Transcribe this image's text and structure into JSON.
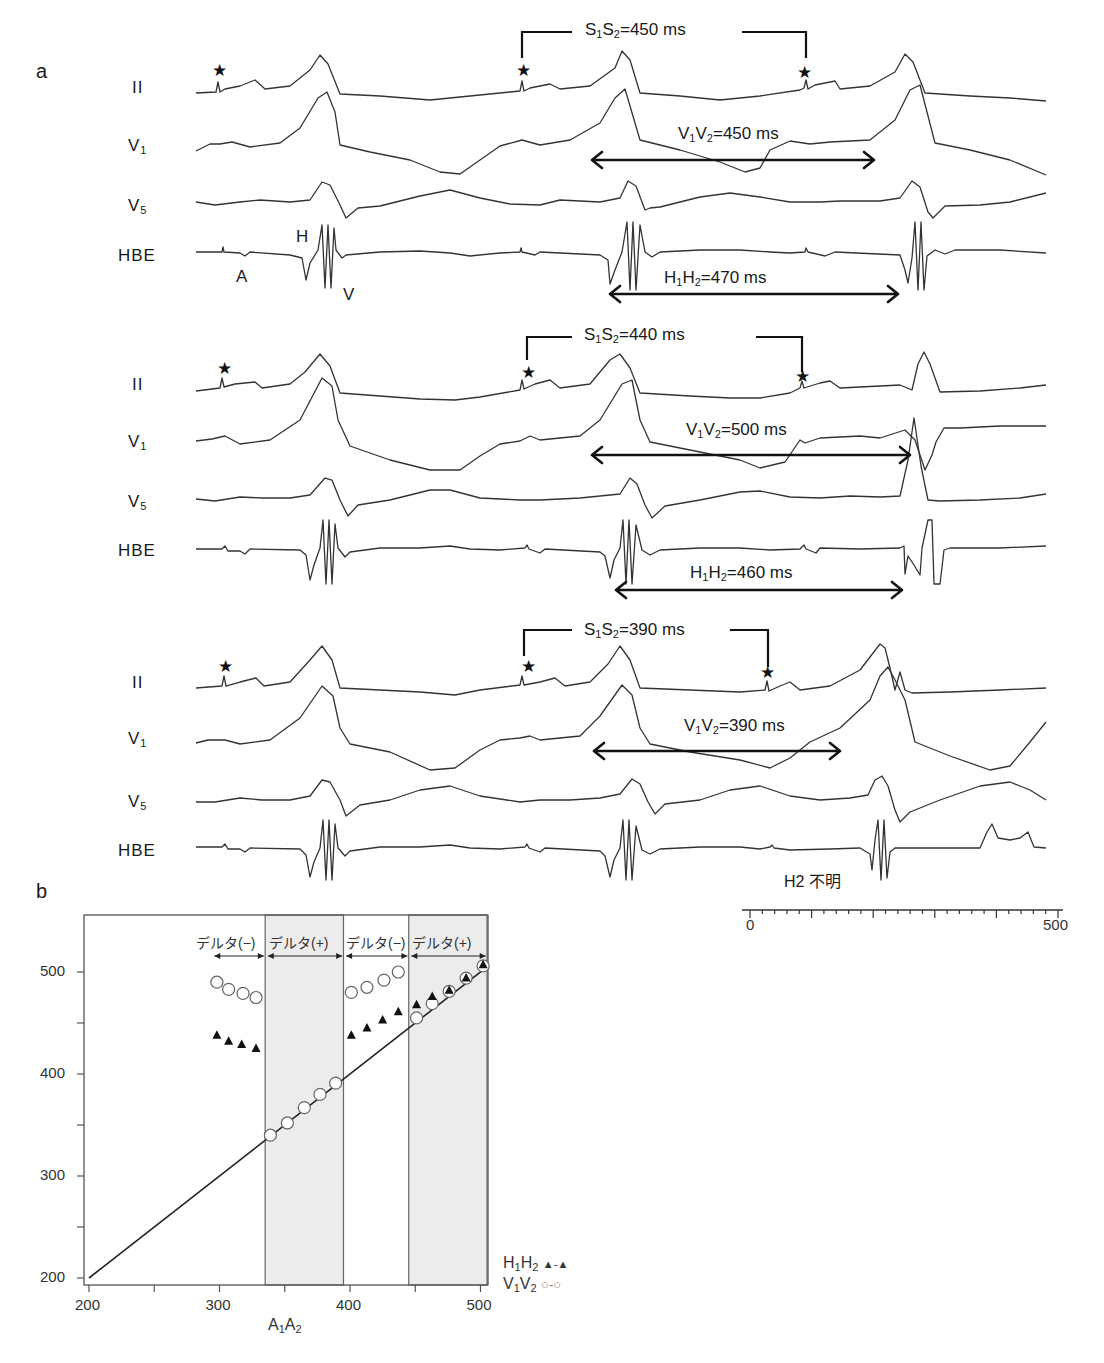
{
  "panel_a": {
    "letter": "a",
    "lead_labels": [
      "II",
      "V1",
      "V5",
      "HBE"
    ],
    "hbe_markers": {
      "A": "A",
      "H": "H",
      "V": "V"
    },
    "strips": [
      {
        "s1s2": {
          "label": "S1S2=450 ms",
          "value_ms": 450
        },
        "v1v2": {
          "label": "V1V2=450 ms",
          "value_ms": 450
        },
        "h1h2": {
          "label": "H1H2=470 ms",
          "value_ms": 470
        }
      },
      {
        "s1s2": {
          "label": "S1S2=440 ms",
          "value_ms": 440
        },
        "v1v2": {
          "label": "V1V2=500 ms",
          "value_ms": 500
        },
        "h1h2": {
          "label": "H1H2=460 ms",
          "value_ms": 460
        }
      },
      {
        "s1s2": {
          "label": "S1S2=390 ms",
          "value_ms": 390
        },
        "v1v2": {
          "label": "V1V2=390 ms",
          "value_ms": 390
        },
        "h2_note": "H2 不明"
      }
    ],
    "stimulus_marker": "★",
    "time_scale": {
      "start_label": "0",
      "end_label": "500",
      "unit": "ms",
      "major_tick_ms": 100,
      "minor_tick_ms": 20
    }
  },
  "panel_b": {
    "letter": "b",
    "region_labels": [
      "デルタ(−)",
      "デルタ(+)",
      "デルタ(−)",
      "デルタ(+)"
    ],
    "legend": [
      {
        "label": "H1H2",
        "marker": "▲-▲"
      },
      {
        "label": "V1V2",
        "marker": "○-○"
      }
    ]
  },
  "chart_data": {
    "type": "scatter",
    "title": "",
    "xlabel": "A1A2",
    "ylabel": "",
    "xlim": [
      200,
      505
    ],
    "ylim": [
      195,
      555
    ],
    "x_ticks": [
      200,
      250,
      300,
      350,
      400,
      450,
      500
    ],
    "x_tick_labels": [
      "200",
      "",
      "300",
      "",
      "400",
      "",
      "500"
    ],
    "y_ticks": [
      200,
      250,
      300,
      350,
      400,
      450,
      500
    ],
    "y_tick_labels": [
      "200",
      "",
      "300",
      "",
      "400",
      "",
      "500"
    ],
    "grid": false,
    "legend_position": "right-bottom-outside",
    "reference_line": {
      "label": "identity",
      "x": [
        200,
        505
      ],
      "y": [
        200,
        505
      ]
    },
    "shaded_regions": [
      {
        "x": [
          335,
          395
        ],
        "label": "デルタ(+)"
      },
      {
        "x": [
          445,
          505
        ],
        "label": "デルタ(+)"
      }
    ],
    "unshaded_regions": [
      {
        "x": [
          295,
          335
        ],
        "label": "デルタ(−)"
      },
      {
        "x": [
          395,
          445
        ],
        "label": "デルタ(−)"
      }
    ],
    "series": [
      {
        "name": "H1H2",
        "marker": "filled-triangle",
        "x": [
          298,
          307,
          317,
          328,
          401,
          413,
          425,
          437,
          451,
          463,
          476,
          489,
          502
        ],
        "y": [
          438,
          432,
          429,
          425,
          438,
          445,
          453,
          461,
          468,
          476,
          482,
          494,
          507
        ]
      },
      {
        "name": "V1V2",
        "marker": "open-circle",
        "x": [
          298,
          307,
          318,
          328,
          339,
          352,
          365,
          377,
          389,
          401,
          413,
          426,
          437,
          451,
          463,
          476,
          489,
          502
        ],
        "y": [
          490,
          483,
          479,
          475,
          340,
          352,
          367,
          380,
          391,
          480,
          485,
          492,
          500,
          455,
          469,
          481,
          494,
          506
        ]
      }
    ]
  }
}
